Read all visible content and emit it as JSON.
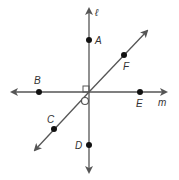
{
  "diagram": {
    "title": "",
    "lines": [
      {
        "name": "ℓ",
        "label": "ℓ",
        "from": [
          89,
          172
        ],
        "to": [
          89,
          8
        ],
        "arrows": "both"
      },
      {
        "name": "m",
        "label": "m",
        "from": [
          12,
          92
        ],
        "to": [
          166,
          92
        ],
        "arrows": "both"
      },
      {
        "name": "CF",
        "label": "",
        "from": [
          35,
          150
        ],
        "to": [
          147,
          31
        ],
        "arrows": "both"
      }
    ],
    "intersection": [
      89,
      92
    ],
    "points": [
      {
        "label": "A",
        "x": 89,
        "y": 40,
        "label_x": 95,
        "label_y": 44
      },
      {
        "label": "B",
        "x": 39,
        "y": 92,
        "label_x": 34,
        "label_y": 83
      },
      {
        "label": "C",
        "x": 54,
        "y": 129,
        "label_x": 47,
        "label_y": 122
      },
      {
        "label": "D",
        "x": 89,
        "y": 145,
        "label_x": 75,
        "label_y": 149
      },
      {
        "label": "E",
        "x": 140,
        "y": 92,
        "label_x": 137,
        "label_y": 107
      },
      {
        "label": "F",
        "x": 124,
        "y": 55,
        "label_x": 124,
        "label_y": 70
      }
    ],
    "line_labels": {
      "l": "ℓ",
      "m": "m"
    },
    "markers": {
      "right_angle": "right-angle square at upper-left of intersection between ℓ and m",
      "angle_circle": "small circle marking angle below-left of intersection"
    },
    "colors": {
      "line": "#555555",
      "point": "#111111",
      "label": "#333333",
      "background": "#ffffff"
    }
  }
}
